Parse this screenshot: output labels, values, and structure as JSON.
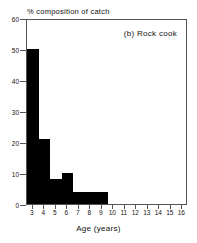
{
  "chart_data": {
    "type": "bar",
    "title": "(b) Rock cook",
    "xlabel": "Age (years)",
    "ylabel": "% composition of catch",
    "xlim": [
      2.5,
      16.5
    ],
    "ylim": [
      0,
      60
    ],
    "grid": false,
    "legend": null,
    "bar_color": "#000000",
    "xticks": [
      3,
      4,
      5,
      6,
      7,
      8,
      9,
      10,
      11,
      12,
      13,
      14,
      15,
      16
    ],
    "yticks": [
      0,
      10,
      20,
      30,
      40,
      50,
      60
    ],
    "categories": [
      3,
      4,
      5,
      6,
      7,
      8,
      9
    ],
    "values": [
      50,
      21,
      8,
      10,
      4,
      4,
      4
    ],
    "bars": [
      {
        "label": "3",
        "x_start": 2.5,
        "x_end": 3.5,
        "value": 50
      },
      {
        "label": "4",
        "x_start": 3.5,
        "x_end": 4.5,
        "value": 21
      },
      {
        "label": "5",
        "x_start": 4.5,
        "x_end": 5.5,
        "value": 8
      },
      {
        "label": "6",
        "x_start": 5.5,
        "x_end": 6.5,
        "value": 10
      },
      {
        "label": "7-9",
        "x_start": 6.5,
        "x_end": 9.5,
        "value": 4
      }
    ]
  },
  "figure": {
    "panel_label": "(b) Rock cook",
    "y_axis_caption": "% composition of catch",
    "x_axis_caption": "Age (years)",
    "axis_color": "#555555",
    "background": "#ffffff"
  }
}
